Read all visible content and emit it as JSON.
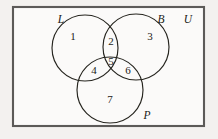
{
  "diagram": {
    "type": "venn-diagram",
    "colors": {
      "page_background": "#f3f1ef",
      "universe_fill": "#fbfaf9",
      "universe_stroke": "#5c5a58",
      "circle_stroke": "#26251f",
      "text": "#1c1b17"
    },
    "universe": {
      "label": "U",
      "x": 13,
      "y": 7,
      "width": 191,
      "height": 119,
      "label_x": 188,
      "label_y": 20
    },
    "sets": [
      {
        "id": "L",
        "label": "L",
        "cx": 85,
        "cy": 48,
        "r": 33,
        "label_x": 61,
        "label_y": 20
      },
      {
        "id": "B",
        "label": "B",
        "cx": 136,
        "cy": 47,
        "r": 33,
        "label_x": 161,
        "label_y": 20
      },
      {
        "id": "P",
        "label": "P",
        "cx": 110,
        "cy": 90,
        "r": 33,
        "label_x": 147,
        "label_y": 116
      }
    ],
    "regions": [
      {
        "id": "region-1",
        "number": "1",
        "membership": "L only",
        "x": 73,
        "y": 37
      },
      {
        "id": "region-2",
        "number": "2",
        "membership": "L and B",
        "x": 111,
        "y": 42
      },
      {
        "id": "region-3",
        "number": "3",
        "membership": "B only",
        "x": 150,
        "y": 37
      },
      {
        "id": "region-4",
        "number": "4",
        "membership": "L and P",
        "x": 94,
        "y": 71
      },
      {
        "id": "region-5",
        "number": "5",
        "membership": "L, B and P",
        "x": 111,
        "y": 62
      },
      {
        "id": "region-6",
        "number": "6",
        "membership": "B and P",
        "x": 128,
        "y": 71
      },
      {
        "id": "region-7",
        "number": "7",
        "membership": "P only",
        "x": 110,
        "y": 100
      }
    ]
  }
}
